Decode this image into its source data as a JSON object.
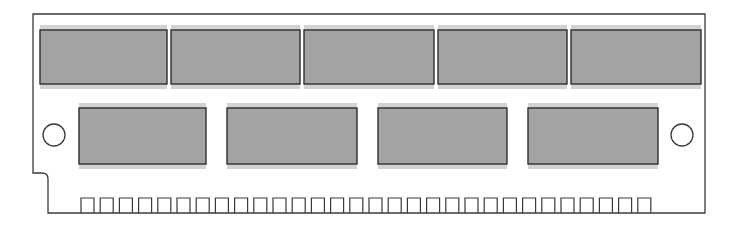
{
  "diagram": {
    "type": "memory-module-outline",
    "colors": {
      "background": "#ffffff",
      "outline": "#3a3a3a",
      "chip_fill": "#a3a3a3",
      "chip_shadow": "#d2d2d2",
      "chip_border": "#2e2e2e"
    },
    "board": {
      "left": 33,
      "top": 14,
      "right": 705,
      "bottom": 213,
      "notch_y": 173,
      "notch_x": 48
    },
    "upper_chips": [
      {
        "x": 40,
        "y": 30,
        "w": 127,
        "h": 54
      },
      {
        "x": 171,
        "y": 30,
        "w": 129,
        "h": 54
      },
      {
        "x": 304,
        "y": 30,
        "w": 130,
        "h": 54
      },
      {
        "x": 438,
        "y": 30,
        "w": 129,
        "h": 54
      },
      {
        "x": 571,
        "y": 30,
        "w": 130,
        "h": 54
      }
    ],
    "lower_chips": [
      {
        "x": 79,
        "y": 108,
        "w": 127,
        "h": 56
      },
      {
        "x": 227,
        "y": 108,
        "w": 130,
        "h": 56
      },
      {
        "x": 378,
        "y": 108,
        "w": 129,
        "h": 56
      },
      {
        "x": 528,
        "y": 108,
        "w": 130,
        "h": 56
      }
    ],
    "mounting_holes": [
      {
        "cx": 54,
        "cy": 135,
        "r": 11
      },
      {
        "cx": 682,
        "cy": 135,
        "r": 11
      }
    ],
    "pins": {
      "count": 30,
      "start_x": 81,
      "pitch": 19.2,
      "width": 13,
      "top": 198
    }
  }
}
